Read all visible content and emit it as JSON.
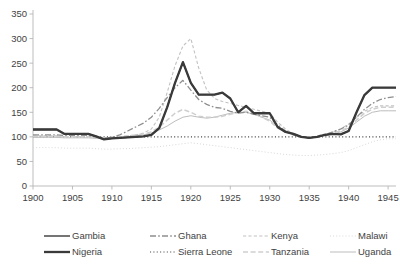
{
  "chart_data": {
    "type": "line",
    "title": "",
    "xlabel": "",
    "ylabel": "",
    "xlim": [
      1900,
      1946
    ],
    "ylim": [
      0,
      350
    ],
    "ytick_values": [
      0,
      50,
      100,
      150,
      200,
      250,
      300,
      350
    ],
    "ytick_labels": [
      "0",
      "50",
      "100",
      "150",
      "200",
      "250",
      "300",
      "350"
    ],
    "xtick_values": [
      1900,
      1905,
      1910,
      1915,
      1920,
      1925,
      1930,
      1935,
      1940,
      1945
    ],
    "xtick_labels": [
      "1900",
      "1905",
      "1910",
      "1915",
      "1920",
      "1925",
      "1930",
      "1935",
      "1940",
      "1945"
    ],
    "grid": false,
    "legend_position": "bottom",
    "x": [
      1900,
      1901,
      1902,
      1903,
      1904,
      1905,
      1906,
      1907,
      1908,
      1909,
      1910,
      1911,
      1912,
      1913,
      1914,
      1915,
      1916,
      1917,
      1918,
      1919,
      1920,
      1921,
      1922,
      1923,
      1924,
      1925,
      1926,
      1927,
      1928,
      1929,
      1930,
      1931,
      1932,
      1933,
      1934,
      1935,
      1936,
      1937,
      1938,
      1939,
      1940,
      1941,
      1942,
      1943,
      1944,
      1945,
      1946
    ],
    "series": [
      {
        "name": "Gambia",
        "style": "solid",
        "width": 1.3,
        "color": "#2b2b2b",
        "values": [
          115,
          115,
          115,
          115,
          106,
          106,
          106,
          106,
          101,
          95,
          97,
          98,
          99,
          100,
          101,
          104,
          118,
          160,
          210,
          252,
          210,
          186,
          186,
          186,
          190,
          178,
          150,
          163,
          148,
          148,
          148,
          120,
          110,
          106,
          100,
          98,
          100,
          104,
          106,
          105,
          112,
          150,
          185,
          200,
          200,
          200,
          200
        ]
      },
      {
        "name": "Ghana",
        "style": "dashdot",
        "width": 1.3,
        "color": "#8e8e8e",
        "values": [
          104,
          104,
          104,
          104,
          103,
          103,
          103,
          103,
          100,
          97,
          99,
          104,
          112,
          120,
          128,
          140,
          158,
          180,
          200,
          215,
          195,
          176,
          166,
          160,
          158,
          152,
          148,
          150,
          146,
          143,
          140,
          124,
          112,
          104,
          100,
          98,
          100,
          104,
          110,
          116,
          124,
          140,
          156,
          168,
          176,
          180,
          182
        ]
      },
      {
        "name": "Kenya",
        "style": "dashed-fine",
        "width": 1.1,
        "color": "#c2c2c2",
        "values": [
          102,
          102,
          102,
          102,
          101,
          101,
          101,
          101,
          99,
          97,
          98,
          100,
          102,
          104,
          108,
          116,
          140,
          190,
          245,
          285,
          300,
          240,
          196,
          178,
          172,
          168,
          164,
          160,
          156,
          152,
          148,
          130,
          116,
          106,
          100,
          98,
          102,
          106,
          110,
          116,
          126,
          140,
          152,
          160,
          163,
          163,
          163
        ]
      },
      {
        "name": "Malawi",
        "style": "dotted-fine",
        "width": 1.0,
        "color": "#d8d8d8",
        "values": [
          78,
          78,
          78,
          78,
          77,
          77,
          77,
          77,
          76,
          75,
          75,
          76,
          76,
          77,
          78,
          79,
          80,
          82,
          84,
          86,
          88,
          86,
          84,
          82,
          80,
          78,
          76,
          74,
          72,
          70,
          68,
          66,
          64,
          63,
          62,
          62,
          63,
          64,
          66,
          68,
          72,
          78,
          84,
          90,
          94,
          96,
          96
        ]
      },
      {
        "name": "Nigeria",
        "style": "solid",
        "width": 2.3,
        "color": "#3a3a3a",
        "values": [
          115,
          115,
          115,
          115,
          106,
          106,
          106,
          106,
          101,
          95,
          97,
          98,
          99,
          100,
          101,
          104,
          118,
          160,
          210,
          252,
          210,
          186,
          186,
          186,
          190,
          178,
          150,
          163,
          148,
          148,
          148,
          120,
          110,
          106,
          100,
          98,
          100,
          104,
          106,
          105,
          112,
          150,
          185,
          200,
          200,
          200,
          200
        ]
      },
      {
        "name": "Sierra Leone",
        "style": "dotted",
        "width": 1.2,
        "color": "#4a4a4a",
        "values": [
          100,
          100,
          100,
          100,
          100,
          100,
          100,
          100,
          100,
          100,
          100,
          100,
          100,
          100,
          100,
          100,
          100,
          100,
          100,
          100,
          100,
          100,
          100,
          100,
          100,
          100,
          100,
          100,
          100,
          100,
          100,
          100,
          100,
          100,
          100,
          100,
          100,
          100,
          100,
          100,
          100,
          100,
          100,
          100,
          100,
          100,
          100
        ]
      },
      {
        "name": "Tanzania",
        "style": "dashed",
        "width": 1.5,
        "color": "#cfcfcf",
        "values": [
          101,
          101,
          101,
          101,
          100,
          100,
          100,
          100,
          99,
          98,
          99,
          100,
          102,
          104,
          106,
          110,
          120,
          134,
          148,
          156,
          150,
          142,
          140,
          140,
          142,
          146,
          150,
          152,
          148,
          140,
          132,
          118,
          110,
          104,
          100,
          99,
          101,
          104,
          108,
          112,
          120,
          134,
          148,
          156,
          160,
          160,
          160
        ]
      },
      {
        "name": "Uganda",
        "style": "solid",
        "width": 1.0,
        "color": "#bdbdbd",
        "values": [
          99,
          99,
          99,
          99,
          98,
          98,
          98,
          98,
          97,
          96,
          97,
          98,
          100,
          102,
          104,
          108,
          114,
          122,
          132,
          140,
          143,
          140,
          138,
          140,
          144,
          148,
          150,
          150,
          146,
          140,
          134,
          122,
          112,
          104,
          100,
          98,
          100,
          103,
          106,
          110,
          118,
          130,
          142,
          150,
          153,
          153,
          153
        ]
      }
    ]
  },
  "legend": {
    "items": [
      {
        "label": "Gambia",
        "series_index": 0
      },
      {
        "label": "Ghana",
        "series_index": 1
      },
      {
        "label": "Kenya",
        "series_index": 2
      },
      {
        "label": "Malawi",
        "series_index": 3
      },
      {
        "label": "Nigeria",
        "series_index": 4
      },
      {
        "label": "Sierra Leone",
        "series_index": 5
      },
      {
        "label": "Tanzania",
        "series_index": 6
      },
      {
        "label": "Uganda",
        "series_index": 7
      }
    ]
  }
}
